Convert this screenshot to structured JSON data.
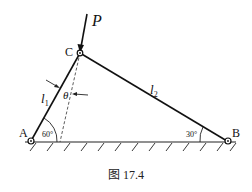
{
  "figure": {
    "caption": "图 17.4",
    "points": {
      "A": {
        "label": "A"
      },
      "B": {
        "label": "B"
      },
      "C": {
        "label": "C"
      }
    },
    "force": {
      "label": "P"
    },
    "members": {
      "l1": {
        "label": "l",
        "sub": "1"
      },
      "l2": {
        "label": "l",
        "sub": "2"
      }
    },
    "angles": {
      "theta": "θ",
      "at_A": "60°",
      "at_B": "30°"
    }
  }
}
